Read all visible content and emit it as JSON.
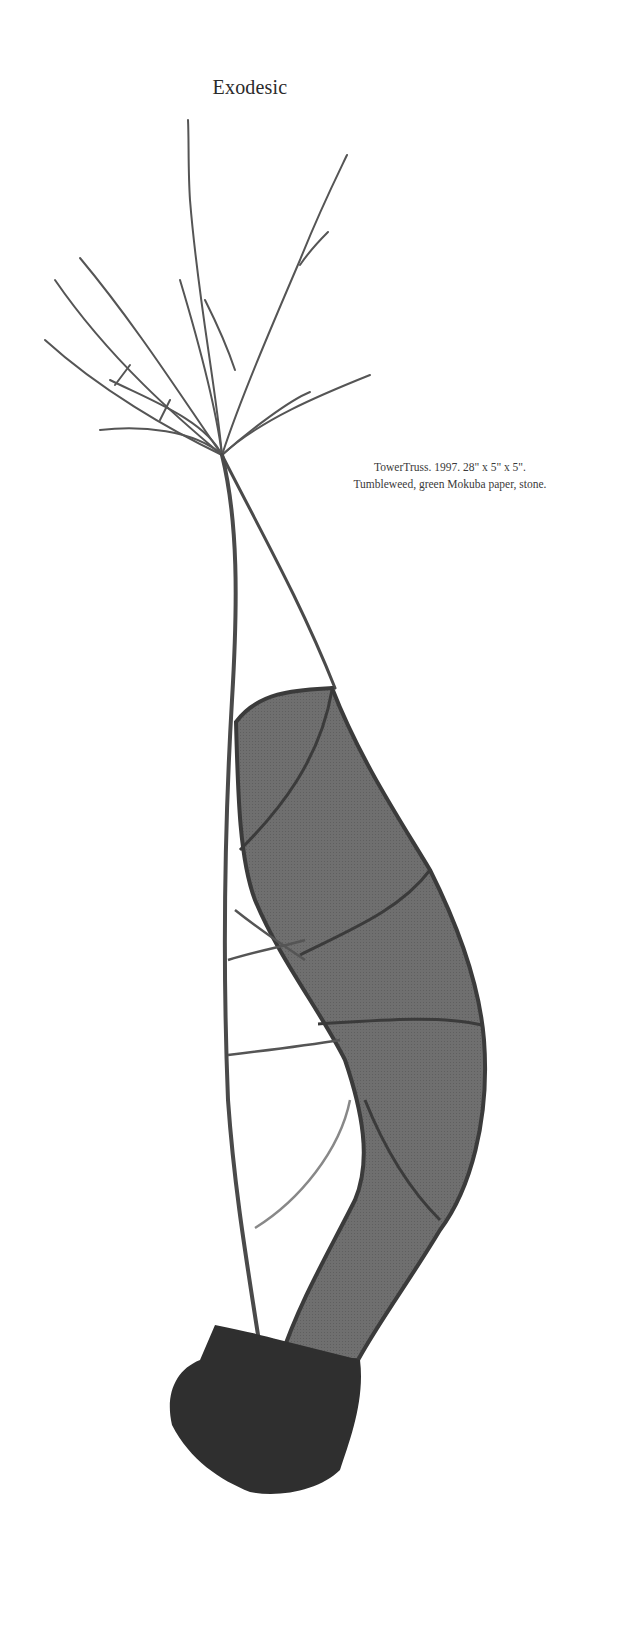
{
  "page": {
    "title": "Exodesic"
  },
  "figure": {
    "caption_line1": "TowerTruss. 1997. 28\" x 5\" x 5\".",
    "caption_line2": "Tumbleweed, green Mokuba paper, stone.",
    "image_alt": "Sculpture: tumbleweed stalk with branching top, a curved band of dark paper lashed to the stem, anchored in a stone base",
    "colors": {
      "paper_fill": "#6e6e6e",
      "stem": "#4a4a4a",
      "stone": "#2e2e2e",
      "background": "#ffffff"
    }
  }
}
